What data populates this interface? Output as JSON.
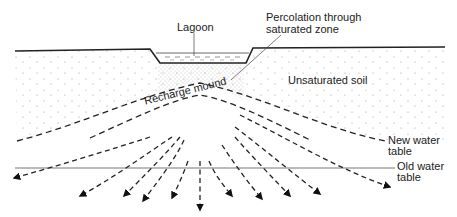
{
  "diagram": {
    "labels": {
      "lagoon": "Lagoon",
      "percolation_line1": "Percolation through",
      "percolation_line2": "saturated zone",
      "unsaturated_soil": "Unsaturated soil",
      "recharge_mound": "Recharge mound",
      "new_water_table_line1": "New water",
      "new_water_table_line2": "table",
      "old_water_table_line1": "Old water",
      "old_water_table_line2": "table"
    },
    "colors": {
      "ink": "#222222",
      "stipple": "#9a9a9a",
      "old_water_table": "#777777",
      "background": "#ffffff"
    },
    "flow_arrow_count": 11
  }
}
